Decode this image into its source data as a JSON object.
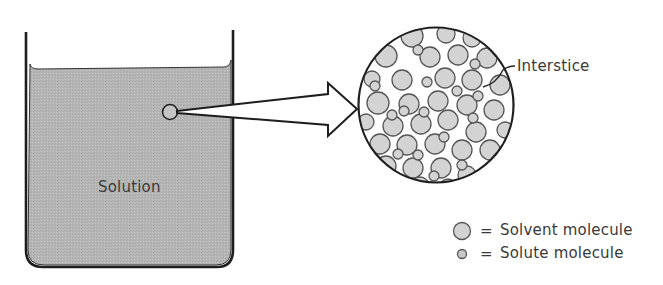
{
  "diagram": {
    "beaker_label": "Solution",
    "interstice_label": "Interstice",
    "legend": [
      {
        "symbol": "large-circle",
        "equals": "=",
        "label": "Solvent molecule"
      },
      {
        "symbol": "small-circle",
        "equals": "=",
        "label": "Solute molecule"
      }
    ],
    "colors": {
      "solution_fill": "#b4b4b4",
      "molecule_fill": "#d4d4d4",
      "stroke": "#222222",
      "text": "#3a3a3a"
    }
  }
}
